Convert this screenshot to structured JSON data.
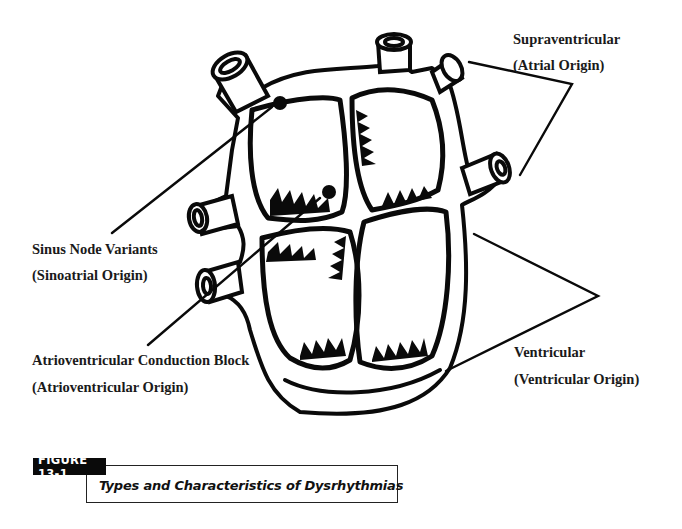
{
  "figure": {
    "tag": "FIGURE 13-1",
    "title": "Types and Characteristics of Dysrhythmias"
  },
  "labels": {
    "supraventricular": {
      "line1": "Supraventricular",
      "line2": "(Atrial Origin)"
    },
    "sinus": {
      "line1": "Sinus Node Variants",
      "line2": "(Sinoatrial Origin)"
    },
    "av_block": {
      "line1": "Atrioventricular Conduction Block",
      "line2": "(Atrioventricular Origin)"
    },
    "ventricular": {
      "line1": "Ventricular",
      "line2": "(Ventricular Origin)"
    }
  },
  "colors": {
    "ink": "#0a0a0a",
    "background": "#ffffff"
  }
}
